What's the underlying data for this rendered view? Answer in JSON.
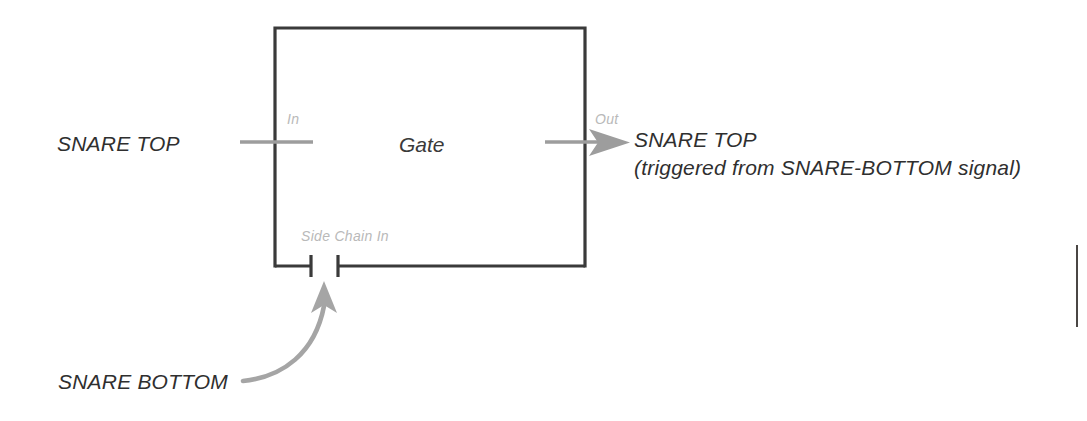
{
  "diagram": {
    "title_block": {
      "name": "gate-processor-block",
      "label": "Gate"
    },
    "ports": {
      "input_label": "In",
      "output_label": "Out",
      "sidechain_label": "Side Chain In"
    },
    "signals": {
      "input_source": "SNARE TOP",
      "output_name": "SNARE TOP",
      "output_note": "(triggered from SNARE-BOTTOM signal)",
      "sidechain_source": "SNARE BOTTOM"
    },
    "colors": {
      "box_stroke": "#3a3a3a",
      "signal_line": "#9a9a9a",
      "faint_text": "#b9b9b9",
      "strong_text": "#2f2f2f",
      "background": "#ffffff"
    },
    "icons": {
      "output_arrow": "arrow-right-icon",
      "sidechain_arrow": "curved-arrow-up-icon",
      "sidechain_break": "terminal-break-icon"
    }
  }
}
